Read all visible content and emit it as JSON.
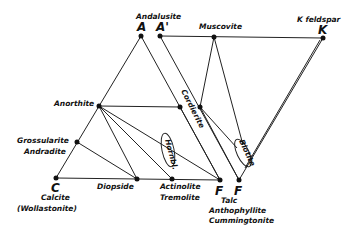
{
  "diagram": {
    "type": "ACF-AKF mineral phase diagram",
    "vertices": {
      "A": {
        "letter": "A",
        "mineral": "Andalusite"
      },
      "A_prime": {
        "letter": "A'"
      },
      "K": {
        "letter": "K",
        "mineral": "K feldspar"
      },
      "C": {
        "letter": "C",
        "mineral": "Calcite",
        "alt": "(Wollastonite)"
      },
      "F1": {
        "letter": "F"
      },
      "F2": {
        "letter": "F",
        "minerals": [
          "Talc",
          "Anthophyllite",
          "Cummingtonite"
        ]
      }
    },
    "minerals": {
      "muscovite": "Muscovite",
      "anorthite": "Anorthite",
      "cordierite": "Cordierite",
      "grossularite": "Grossularite",
      "andradite": "Andradite",
      "diopside": "Diopside",
      "actinolite": "Actinolite",
      "tremolite": "Tremolite",
      "hornblende": "Hornbl.",
      "biotite": "Biotite"
    },
    "colors": {
      "line": "#222222",
      "text": "#111111",
      "background": "#ffffff"
    }
  }
}
